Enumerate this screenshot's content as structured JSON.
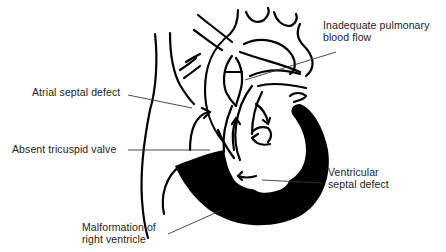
{
  "diagram": {
    "type": "anatomical illustration",
    "colors": {
      "ink": "#000000",
      "label_text": "#222222",
      "background": "#ffffff"
    },
    "labels": [
      {
        "id": "pulmonary",
        "lines": [
          "Inadequate pulmonary",
          "blood flow"
        ]
      },
      {
        "id": "asd",
        "lines": [
          "Atrial septal defect"
        ]
      },
      {
        "id": "tricuspid",
        "lines": [
          "Absent tricuspid valve"
        ]
      },
      {
        "id": "vsd",
        "lines": [
          "Ventricular",
          "septal defect"
        ]
      },
      {
        "id": "rv",
        "lines": [
          "Malformation of",
          "right ventricle"
        ]
      }
    ]
  }
}
